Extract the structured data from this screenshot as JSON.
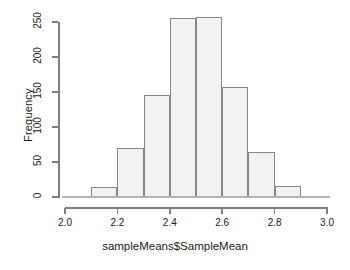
{
  "chart_data": {
    "type": "bar",
    "title": "",
    "subtitle": "",
    "xlabel": "sampleMeans$SampleMean",
    "ylabel": "Frequency",
    "xlim": [
      2.0,
      3.0
    ],
    "ylim": [
      0,
      250
    ],
    "grid": false,
    "legend": null,
    "bin_width": 0.1,
    "bin_edges": [
      2.0,
      2.1,
      2.2,
      2.3,
      2.4,
      2.5,
      2.6,
      2.7,
      2.8,
      2.9,
      3.0
    ],
    "categories": [
      "2.0-2.1",
      "2.1-2.2",
      "2.2-2.3",
      "2.3-2.4",
      "2.4-2.5",
      "2.5-2.6",
      "2.6-2.7",
      "2.7-2.8",
      "2.8-2.9",
      "2.9-3.0"
    ],
    "values": [
      0,
      14,
      70,
      146,
      256,
      257,
      157,
      64,
      16,
      0
    ],
    "xticks": [
      "2.0",
      "2.2",
      "2.4",
      "2.6",
      "2.8",
      "3.0"
    ],
    "xtick_values": [
      2.0,
      2.2,
      2.4,
      2.6,
      2.8,
      3.0
    ],
    "yticks": [
      "0",
      "50",
      "100",
      "150",
      "200",
      "250"
    ],
    "ytick_values": [
      0,
      50,
      100,
      150,
      200,
      250
    ],
    "bar_fill_color": "#f2f2f2",
    "bar_border_color": "#878787",
    "axis_color": "#7f7f7f",
    "text_color": "#1a1a1a",
    "background_color": "#ffffff"
  }
}
